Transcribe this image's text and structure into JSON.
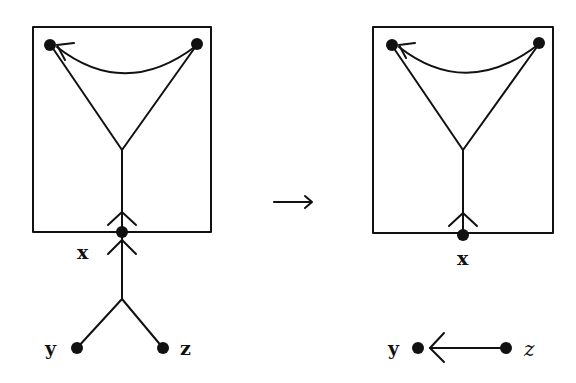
{
  "figure": {
    "type": "graph-rewrite-diagram",
    "transition_symbol": "⟶",
    "left": {
      "labels": {
        "x": "x",
        "y": "y",
        "z": "z"
      },
      "description": "Box containing two top nodes joined by a curved arrow, a Y-shaped fork down to node x on the box boundary; below x, an arrow up from a fork connecting nodes y and z"
    },
    "right": {
      "labels": {
        "x": "x",
        "y": "y",
        "z": "z"
      },
      "description": "Same box with node x on boundary; below, an arrow from node z pointing left to node y"
    }
  },
  "colors": {
    "ink": "#111111",
    "background": "#ffffff"
  }
}
